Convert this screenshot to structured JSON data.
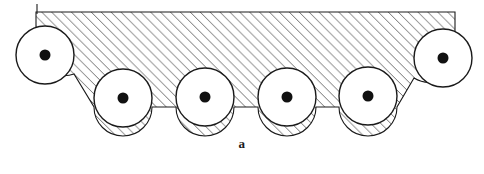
{
  "figure": {
    "label": "a",
    "title": "",
    "background": "#ffffff",
    "stroke_color": "#1a1a1a",
    "hatch_color": "#555555",
    "hub_color": "#111111",
    "body_fill": "#ffffff"
  },
  "geometry": {
    "width": 484,
    "height": 174,
    "body_top_y": 12,
    "body_left_x": 36,
    "body_right_x": 455,
    "valley_bottom_y": 107,
    "hatch_angle_deg": 45,
    "hatch_spacing_px": 7,
    "roller_radius": 29,
    "hub_radius": 5.5
  },
  "rollers": [
    {
      "name": "roller-left-end",
      "cx": 45,
      "cy": 55,
      "r": 29,
      "hub_r": 5.5
    },
    {
      "name": "roller-lower-1",
      "cx": 123,
      "cy": 98,
      "r": 29,
      "hub_r": 5.5
    },
    {
      "name": "roller-lower-2",
      "cx": 205,
      "cy": 97,
      "r": 29,
      "hub_r": 5.5
    },
    {
      "name": "roller-lower-3",
      "cx": 287,
      "cy": 97,
      "r": 29,
      "hub_r": 5.5
    },
    {
      "name": "roller-lower-4",
      "cx": 368,
      "cy": 96,
      "r": 29,
      "hub_r": 5.5
    },
    {
      "name": "roller-right-end",
      "cx": 443,
      "cy": 58,
      "r": 29,
      "hub_r": 5.5
    }
  ]
}
